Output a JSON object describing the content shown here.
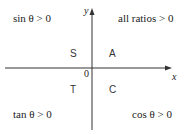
{
  "diagram": {
    "axes": {
      "x_label": "x",
      "y_label": "y",
      "origin_label": "0"
    },
    "quadrant_letters": {
      "q1": "A",
      "q2": "S",
      "q3": "T",
      "q4": "C"
    },
    "quadrant_rules": {
      "q1": "all ratios > 0",
      "q2": "sin θ > 0",
      "q3": "tan θ > 0",
      "q4": "cos θ > 0"
    }
  }
}
